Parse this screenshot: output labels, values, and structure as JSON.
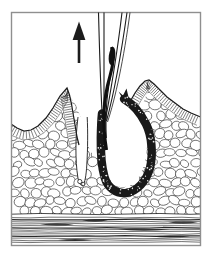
{
  "figure": {
    "paper_color": "#ffffff",
    "ink_color": "#1c1c1c",
    "frame_color": "#8f8f8f",
    "texture_color": "#3a3a3a",
    "follicle_color": "#191919",
    "hair_color": "#101010",
    "arrow": {
      "icon": "up-arrow",
      "direction": "up"
    },
    "parts": [
      "up-arrow",
      "forceps",
      "plucked-hair",
      "epidermis",
      "empty-follicle-canal",
      "hair-follicle-loop",
      "subcutaneous-fat",
      "muscle-layer",
      "frame-border"
    ]
  }
}
